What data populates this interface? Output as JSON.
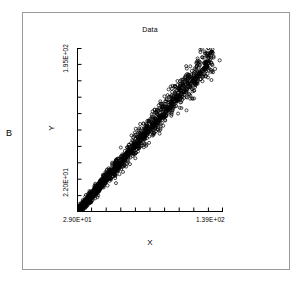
{
  "panel": {
    "label": "B"
  },
  "chart_data": {
    "type": "scatter",
    "title": "Data",
    "xlabel": "X",
    "ylabel": "Y",
    "xlim": [
      29.0,
      139.0
    ],
    "ylim": [
      22.0,
      195.0
    ],
    "x_tick_labels": [
      "2.90E+01",
      "1.39E+02"
    ],
    "y_tick_labels": [
      "2.20E+01",
      "1.95E+02"
    ],
    "x_tick_count": 11,
    "y_tick_count": 11,
    "grid": false,
    "legend": "none",
    "marker": "open-circle",
    "marker_color": "#000000",
    "trendline": {
      "present": true,
      "color": "#000000",
      "x_start": 29.0,
      "y_start": 22.0,
      "x_end": 132.0,
      "y_end": 188.0
    },
    "n_points": 1400,
    "points": [
      [
        29.4,
        23.1
      ],
      [
        30.1,
        24.0
      ],
      [
        30.8,
        25.4
      ],
      [
        31.2,
        24.8
      ],
      [
        31.9,
        26.6
      ],
      [
        32.5,
        27.3
      ],
      [
        33.0,
        28.9
      ],
      [
        33.6,
        28.1
      ],
      [
        34.2,
        30.2
      ],
      [
        34.8,
        31.5
      ],
      [
        35.3,
        30.8
      ],
      [
        35.9,
        32.7
      ],
      [
        36.4,
        33.9
      ],
      [
        37.0,
        33.2
      ],
      [
        37.6,
        35.1
      ],
      [
        38.1,
        36.4
      ],
      [
        38.7,
        35.8
      ],
      [
        39.3,
        37.9
      ],
      [
        39.8,
        39.0
      ],
      [
        40.4,
        38.3
      ],
      [
        41.0,
        40.5
      ],
      [
        41.5,
        41.7
      ],
      [
        42.1,
        41.0
      ],
      [
        42.7,
        43.2
      ],
      [
        43.2,
        44.4
      ],
      [
        43.8,
        43.6
      ],
      [
        44.4,
        45.9
      ],
      [
        44.9,
        47.1
      ],
      [
        45.5,
        46.3
      ],
      [
        46.1,
        48.6
      ],
      [
        46.6,
        49.8
      ],
      [
        47.2,
        49.0
      ],
      [
        47.8,
        51.3
      ],
      [
        48.3,
        52.5
      ],
      [
        48.9,
        51.7
      ],
      [
        49.5,
        54.0
      ],
      [
        50.0,
        55.2
      ],
      [
        50.6,
        54.4
      ],
      [
        51.2,
        56.7
      ],
      [
        51.7,
        57.9
      ],
      [
        52.3,
        57.1
      ],
      [
        52.9,
        59.4
      ],
      [
        53.4,
        60.6
      ],
      [
        54.0,
        59.8
      ],
      [
        54.6,
        62.1
      ],
      [
        55.1,
        63.3
      ],
      [
        55.7,
        62.5
      ],
      [
        56.3,
        64.8
      ],
      [
        56.8,
        66.0
      ],
      [
        57.4,
        65.2
      ],
      [
        58.0,
        67.5
      ],
      [
        58.5,
        68.7
      ],
      [
        59.1,
        67.9
      ],
      [
        59.7,
        70.2
      ],
      [
        60.2,
        71.4
      ],
      [
        60.8,
        70.6
      ],
      [
        61.4,
        72.9
      ],
      [
        61.9,
        74.1
      ],
      [
        62.5,
        73.3
      ],
      [
        63.1,
        75.6
      ],
      [
        63.6,
        76.8
      ],
      [
        64.2,
        76.0
      ],
      [
        64.8,
        78.3
      ],
      [
        65.3,
        79.5
      ],
      [
        65.9,
        78.7
      ],
      [
        66.5,
        81.0
      ],
      [
        67.0,
        82.2
      ],
      [
        67.6,
        81.4
      ],
      [
        68.2,
        83.7
      ],
      [
        68.7,
        84.9
      ],
      [
        69.3,
        84.1
      ],
      [
        69.9,
        86.4
      ],
      [
        70.4,
        87.6
      ],
      [
        71.0,
        86.8
      ],
      [
        71.6,
        89.1
      ],
      [
        72.1,
        90.3
      ],
      [
        72.7,
        89.5
      ],
      [
        73.3,
        91.8
      ],
      [
        73.8,
        93.0
      ],
      [
        74.4,
        92.2
      ],
      [
        75.0,
        94.5
      ],
      [
        75.5,
        95.7
      ],
      [
        76.1,
        94.9
      ],
      [
        76.7,
        97.2
      ],
      [
        77.2,
        98.4
      ],
      [
        77.8,
        97.6
      ],
      [
        78.4,
        99.9
      ],
      [
        78.9,
        101.1
      ],
      [
        79.5,
        100.3
      ],
      [
        80.1,
        102.6
      ],
      [
        80.6,
        103.8
      ],
      [
        81.2,
        103.0
      ],
      [
        81.8,
        105.3
      ],
      [
        82.3,
        106.5
      ],
      [
        82.9,
        105.7
      ],
      [
        83.5,
        108.0
      ],
      [
        84.0,
        109.2
      ],
      [
        84.6,
        108.4
      ],
      [
        85.2,
        110.7
      ],
      [
        85.7,
        111.9
      ],
      [
        86.3,
        111.1
      ],
      [
        86.9,
        113.4
      ],
      [
        87.4,
        114.6
      ],
      [
        88.0,
        113.8
      ],
      [
        88.6,
        116.1
      ],
      [
        89.1,
        117.3
      ],
      [
        89.7,
        116.5
      ],
      [
        90.3,
        118.8
      ],
      [
        90.8,
        120.0
      ],
      [
        91.4,
        119.2
      ],
      [
        92.0,
        121.5
      ],
      [
        92.5,
        122.7
      ],
      [
        93.1,
        121.9
      ],
      [
        93.7,
        124.2
      ],
      [
        94.2,
        125.4
      ],
      [
        94.8,
        124.6
      ],
      [
        95.4,
        126.9
      ],
      [
        95.9,
        128.1
      ],
      [
        96.5,
        127.3
      ],
      [
        97.1,
        129.6
      ],
      [
        97.6,
        130.8
      ],
      [
        98.2,
        130.0
      ],
      [
        98.8,
        132.3
      ],
      [
        99.3,
        133.5
      ],
      [
        99.9,
        132.7
      ],
      [
        100.5,
        135.0
      ],
      [
        101.0,
        136.2
      ],
      [
        101.6,
        135.4
      ],
      [
        102.2,
        137.7
      ],
      [
        102.7,
        138.9
      ],
      [
        103.3,
        138.1
      ],
      [
        103.9,
        140.4
      ],
      [
        104.4,
        141.6
      ],
      [
        105.0,
        140.8
      ],
      [
        105.6,
        143.1
      ],
      [
        106.1,
        144.3
      ],
      [
        106.7,
        143.5
      ],
      [
        107.3,
        145.8
      ],
      [
        107.8,
        147.0
      ],
      [
        108.4,
        146.2
      ],
      [
        109.0,
        148.5
      ],
      [
        109.5,
        149.7
      ],
      [
        110.1,
        148.9
      ],
      [
        110.7,
        151.2
      ],
      [
        111.2,
        152.4
      ],
      [
        111.8,
        151.6
      ],
      [
        112.4,
        153.9
      ],
      [
        112.9,
        155.1
      ],
      [
        113.5,
        154.3
      ],
      [
        114.1,
        156.6
      ],
      [
        114.6,
        157.8
      ],
      [
        115.2,
        157.0
      ],
      [
        115.8,
        159.3
      ],
      [
        116.3,
        160.5
      ],
      [
        116.9,
        159.7
      ],
      [
        117.5,
        162.0
      ],
      [
        118.0,
        163.2
      ],
      [
        118.6,
        162.4
      ],
      [
        119.2,
        164.7
      ],
      [
        119.7,
        165.9
      ],
      [
        120.3,
        165.1
      ],
      [
        120.9,
        167.4
      ],
      [
        121.4,
        168.6
      ],
      [
        122.0,
        167.8
      ],
      [
        122.6,
        170.1
      ],
      [
        123.1,
        171.3
      ],
      [
        123.7,
        170.5
      ],
      [
        124.3,
        172.8
      ],
      [
        124.8,
        174.0
      ],
      [
        125.4,
        173.2
      ],
      [
        126.0,
        175.5
      ],
      [
        126.5,
        176.7
      ],
      [
        127.1,
        175.9
      ],
      [
        127.7,
        178.2
      ],
      [
        128.2,
        179.4
      ],
      [
        71.5,
        101.0
      ],
      [
        73.0,
        103.5
      ],
      [
        82.0,
        118.0
      ],
      [
        84.5,
        120.5
      ],
      [
        93.0,
        136.0
      ],
      [
        100.0,
        144.0
      ],
      [
        104.0,
        150.0
      ],
      [
        108.5,
        157.0
      ],
      [
        113.0,
        163.0
      ],
      [
        117.0,
        168.0
      ],
      [
        61.0,
        62.0
      ],
      [
        66.0,
        70.0
      ],
      [
        88.0,
        112.0
      ],
      [
        96.0,
        124.0
      ],
      [
        110.0,
        146.0
      ],
      [
        119.0,
        158.0
      ],
      [
        122.0,
        162.0
      ],
      [
        125.0,
        167.0
      ],
      [
        128.0,
        172.0
      ],
      [
        131.0,
        177.0
      ],
      [
        136.5,
        182.0
      ],
      [
        133.0,
        173.0
      ],
      [
        130.0,
        170.0
      ],
      [
        126.0,
        165.0
      ],
      [
        123.5,
        160.0
      ],
      [
        86.0,
        128.0
      ],
      [
        87.5,
        130.0
      ],
      [
        58.0,
        60.5
      ],
      [
        52.0,
        50.0
      ],
      [
        66.5,
        73.0
      ]
    ]
  }
}
